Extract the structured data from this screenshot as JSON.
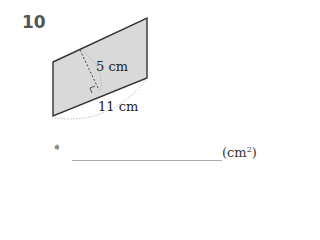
{
  "problem": {
    "number": "10",
    "height_label": "5 cm",
    "base_label": "11 cm",
    "answer_unit": "(cm",
    "answer_unit_exp": "2",
    "answer_unit_close": ")"
  },
  "colors": {
    "fill": "#d9d9d9",
    "stroke": "#333333"
  }
}
